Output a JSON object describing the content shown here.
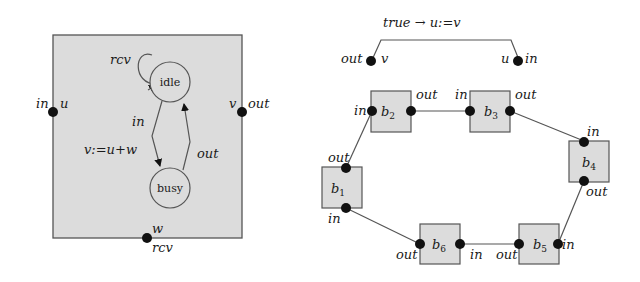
{
  "colors": {
    "box_fill": "#dcdcdc",
    "stroke": "#555555",
    "port": "#111111",
    "background": "#ffffff"
  },
  "left_diagram": {
    "component_box": {
      "label": "component"
    },
    "ports": {
      "in_port": {
        "label": "in",
        "var": "u"
      },
      "out_port": {
        "label": "out",
        "var": "v"
      },
      "rcv_port": {
        "label": "rcv",
        "var": "w"
      }
    },
    "states": {
      "idle": "idle",
      "busy": "busy"
    },
    "transitions": {
      "self_loop": "rcv",
      "idle_to_busy": "in",
      "idle_to_busy_action": "v:=u+w",
      "busy_to_idle": "out"
    }
  },
  "right_diagram": {
    "connector": {
      "guard": "true → u:=v",
      "left_port": {
        "label": "out",
        "var": "v"
      },
      "right_port": {
        "label": "u",
        "var_side": "in"
      }
    },
    "blocks": [
      {
        "id": "b1",
        "name": "b",
        "sub": "1",
        "top_port": "out",
        "bottom_port": "in"
      },
      {
        "id": "b2",
        "name": "b",
        "sub": "2",
        "left_port": "in",
        "right_port": "out"
      },
      {
        "id": "b3",
        "name": "b",
        "sub": "3",
        "left_port": "in",
        "right_port": "out"
      },
      {
        "id": "b4",
        "name": "b",
        "sub": "4",
        "top_port": "in",
        "bottom_port": "out"
      },
      {
        "id": "b5",
        "name": "b",
        "sub": "5",
        "left_port": "out",
        "right_port": "in"
      },
      {
        "id": "b6",
        "name": "b",
        "sub": "6",
        "left_port": "out",
        "right_port": "in"
      }
    ]
  }
}
